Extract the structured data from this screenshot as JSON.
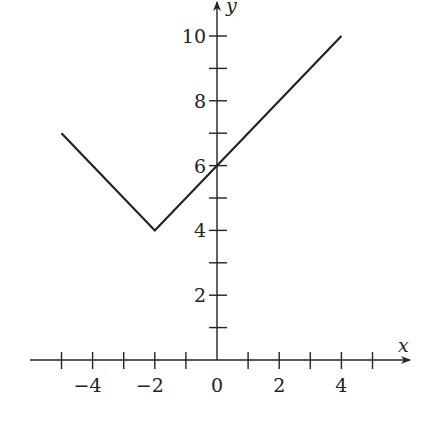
{
  "chart_data": {
    "type": "line",
    "title": "",
    "xlabel": "x",
    "ylabel": "y",
    "xlim": [
      -5.5,
      6
    ],
    "ylim": [
      0,
      11
    ],
    "grid": false,
    "x_tick_labels": [
      "−4",
      "−2",
      "0",
      "2",
      "4"
    ],
    "x_tick_label_values": [
      -4,
      -2,
      0,
      2,
      4
    ],
    "x_minor_ticks": [
      -5,
      -4,
      -3,
      -2,
      -1,
      0,
      1,
      2,
      3,
      4,
      5
    ],
    "y_tick_labels": [
      "2",
      "4",
      "6",
      "8",
      "10"
    ],
    "y_tick_label_values": [
      2,
      4,
      6,
      8,
      10
    ],
    "y_minor_ticks": [
      1,
      2,
      3,
      4,
      5,
      6,
      7,
      8,
      9,
      10
    ],
    "series": [
      {
        "name": "f(x)",
        "x": [
          -5,
          -2,
          4
        ],
        "y": [
          7,
          4,
          10
        ]
      }
    ],
    "line_color": "#222222"
  }
}
